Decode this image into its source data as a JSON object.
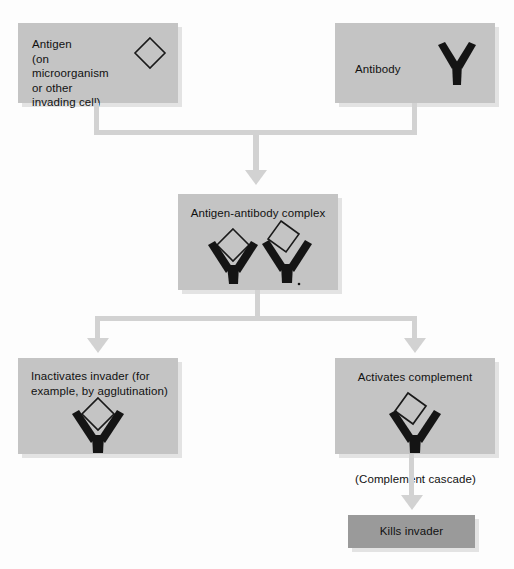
{
  "diagram": {
    "background_color": "#fdfdfd",
    "box_fill": "#c4c4c4",
    "box_fill_dark": "#9a9a9a",
    "connector_color": "#d2d2d2",
    "glyph_color": "#111111"
  },
  "nodes": {
    "antigen": {
      "label": "Antigen\n(on microorganism\nor other invading cell)",
      "glyph": "diamond-outline"
    },
    "antibody": {
      "label": "Antibody",
      "glyph": "y-shape"
    },
    "complex": {
      "label": "Antigen-antibody complex",
      "glyph": "two-y-shapes-with-diamonds"
    },
    "inactivates": {
      "label": "Inactivates invader (for\nexample, by agglutination)",
      "glyph": "y-shape-with-diamond"
    },
    "activates": {
      "label": "Activates complement",
      "glyph": "y-shape-with-tilted-diamond"
    },
    "cascade_note": {
      "label": "(Complement cascade)"
    },
    "kills": {
      "label": "Kills invader"
    }
  }
}
